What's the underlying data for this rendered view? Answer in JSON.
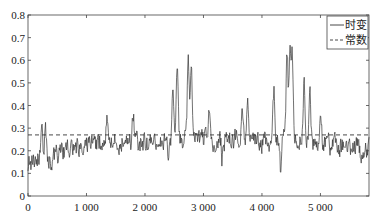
{
  "chart_data": {
    "type": "line",
    "title": "",
    "xlabel": "",
    "ylabel": "",
    "xlim": [
      0,
      5830
    ],
    "ylim": [
      0,
      0.8
    ],
    "x_ticks": [
      0,
      1000,
      2000,
      3000,
      4000,
      5000
    ],
    "x_tick_labels": [
      "0",
      "1 000",
      "2 000",
      "3 000",
      "4 000",
      "5 000"
    ],
    "y_ticks": [
      0,
      0.1,
      0.2,
      0.3,
      0.4,
      0.5,
      0.6,
      0.7,
      0.8
    ],
    "y_tick_labels": [
      "0",
      "0.1",
      "0.2",
      "0.3",
      "0.4",
      "0.5",
      "0.6",
      "0.7",
      "0.8"
    ],
    "grid": false,
    "legend_position": "upper right",
    "series": [
      {
        "name": "时变",
        "style": "solid",
        "color": "#333333",
        "description": "time-varying noisy series, baseline ~0.15-0.30 with spikes",
        "envelope": [
          [
            0,
            0.15
          ],
          [
            200,
            0.17
          ],
          [
            400,
            0.18
          ],
          [
            800,
            0.21
          ],
          [
            1200,
            0.24
          ],
          [
            1600,
            0.24
          ],
          [
            2000,
            0.23
          ],
          [
            2400,
            0.23
          ],
          [
            2800,
            0.26
          ],
          [
            3200,
            0.24
          ],
          [
            3600,
            0.25
          ],
          [
            4000,
            0.23
          ],
          [
            4400,
            0.26
          ],
          [
            4800,
            0.24
          ],
          [
            5200,
            0.22
          ],
          [
            5830,
            0.21
          ]
        ],
        "peaks": [
          {
            "x": 230,
            "y": 0.33
          },
          {
            "x": 300,
            "y": 0.34
          },
          {
            "x": 1350,
            "y": 0.37
          },
          {
            "x": 1800,
            "y": 0.39
          },
          {
            "x": 2480,
            "y": 0.47
          },
          {
            "x": 2550,
            "y": 0.58
          },
          {
            "x": 2740,
            "y": 0.64
          },
          {
            "x": 2790,
            "y": 0.61
          },
          {
            "x": 3100,
            "y": 0.37
          },
          {
            "x": 3660,
            "y": 0.44
          },
          {
            "x": 3750,
            "y": 0.42
          },
          {
            "x": 4200,
            "y": 0.52
          },
          {
            "x": 4430,
            "y": 0.67
          },
          {
            "x": 4480,
            "y": 0.65
          },
          {
            "x": 4520,
            "y": 0.63
          },
          {
            "x": 4720,
            "y": 0.55
          },
          {
            "x": 4820,
            "y": 0.51
          },
          {
            "x": 5000,
            "y": 0.39
          }
        ],
        "troughs": [
          {
            "x": 50,
            "y": 0.11
          },
          {
            "x": 400,
            "y": 0.12
          },
          {
            "x": 2400,
            "y": 0.14
          },
          {
            "x": 3320,
            "y": 0.16
          },
          {
            "x": 4320,
            "y": 0.1
          },
          {
            "x": 5700,
            "y": 0.17
          }
        ],
        "points": 700,
        "noise_amplitude": 0.045,
        "seed": 7
      },
      {
        "name": "常数",
        "style": "dashed",
        "color": "#333333",
        "values": [
          [
            0,
            0.27
          ],
          [
            5830,
            0.27
          ]
        ]
      }
    ]
  },
  "legend": {
    "items": [
      {
        "label": "时变",
        "style": "solid"
      },
      {
        "label": "常数",
        "style": "dashed"
      }
    ]
  },
  "colors": {
    "axis": "#444444",
    "line": "#3a3a3a",
    "background": "#ffffff"
  }
}
